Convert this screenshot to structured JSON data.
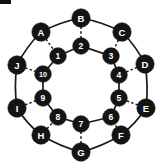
{
  "figure": {
    "title": "",
    "type": "graph-diagram",
    "background_color": "#ffffff",
    "node_color": "#141414",
    "node_label_color": "#ffffff",
    "edge_color": "#1a1a1a",
    "width": 163,
    "height": 166
  },
  "chart_data": {
    "type": "graph",
    "center": {
      "x": 81,
      "y": 83
    },
    "outer_radius": 65,
    "inner_radius": 38,
    "outer_nodes": [
      {
        "label": "A",
        "x": 41,
        "y": 32,
        "r": 9.2
      },
      {
        "label": "B",
        "x": 81,
        "y": 18,
        "r": 9.2
      },
      {
        "label": "C",
        "x": 122,
        "y": 32,
        "r": 9.2
      },
      {
        "label": "D",
        "x": 145,
        "y": 64,
        "r": 9.2
      },
      {
        "label": "E",
        "x": 146,
        "y": 108,
        "r": 9.2
      },
      {
        "label": "F",
        "x": 121,
        "y": 135,
        "r": 9.2
      },
      {
        "label": "G",
        "x": 81,
        "y": 152,
        "r": 9.2
      },
      {
        "label": "H",
        "x": 41,
        "y": 135,
        "r": 9.2
      },
      {
        "label": "I",
        "x": 17,
        "y": 108,
        "r": 9.2
      },
      {
        "label": "J",
        "x": 17,
        "y": 65,
        "r": 9.2
      }
    ],
    "inner_nodes": [
      {
        "label": "1",
        "x": 58,
        "y": 56,
        "r": 8.3
      },
      {
        "label": "2",
        "x": 81,
        "y": 46,
        "r": 8.3
      },
      {
        "label": "3",
        "x": 111,
        "y": 56,
        "r": 8.3
      },
      {
        "label": "4",
        "x": 119,
        "y": 75,
        "r": 8.3
      },
      {
        "label": "5",
        "x": 119,
        "y": 98,
        "r": 8.3
      },
      {
        "label": "6",
        "x": 111,
        "y": 117,
        "r": 8.3
      },
      {
        "label": "7",
        "x": 81,
        "y": 124,
        "r": 8.3
      },
      {
        "label": "8",
        "x": 58,
        "y": 117,
        "r": 8.3
      },
      {
        "label": "9",
        "x": 43,
        "y": 98,
        "r": 8.3
      },
      {
        "label": "10",
        "x": 43,
        "y": 74,
        "r": 8.3
      }
    ],
    "outer_edges": [
      [
        "A",
        "B"
      ],
      [
        "B",
        "C"
      ],
      [
        "C",
        "D"
      ],
      [
        "D",
        "E"
      ],
      [
        "E",
        "F"
      ],
      [
        "F",
        "G"
      ],
      [
        "G",
        "H"
      ],
      [
        "H",
        "I"
      ],
      [
        "I",
        "J"
      ],
      [
        "J",
        "A"
      ]
    ],
    "inner_edges": [
      [
        "1",
        "2"
      ],
      [
        "2",
        "3"
      ],
      [
        "3",
        "4"
      ],
      [
        "4",
        "5"
      ],
      [
        "5",
        "6"
      ],
      [
        "6",
        "7"
      ],
      [
        "7",
        "8"
      ],
      [
        "8",
        "9"
      ],
      [
        "9",
        "10"
      ],
      [
        "10",
        "1"
      ]
    ],
    "spoke_edges": [
      [
        "A",
        "1"
      ],
      [
        "B",
        "2"
      ],
      [
        "C",
        "3"
      ],
      [
        "D",
        "4"
      ],
      [
        "E",
        "5"
      ],
      [
        "F",
        "6"
      ],
      [
        "G",
        "7"
      ],
      [
        "H",
        "8"
      ],
      [
        "I",
        "9"
      ],
      [
        "J",
        "10"
      ]
    ],
    "edge_styles": {
      "outer": "solid",
      "inner": "solid",
      "spoke": "dashed"
    }
  }
}
